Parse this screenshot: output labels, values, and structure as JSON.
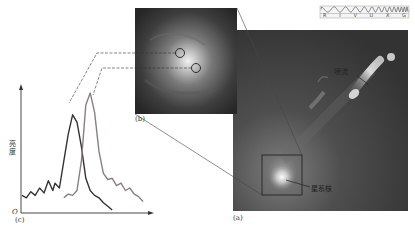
{
  "figure": {
    "panels": {
      "a": {
        "label": "(a)",
        "annotations": {
          "jet": "喷流",
          "nucleus": "星系核"
        }
      },
      "b": {
        "label": "(b)"
      },
      "c": {
        "label": "(c)",
        "origin": "O",
        "ylabel": "亮度"
      }
    },
    "spectrum_band": {
      "ticks": [
        "R",
        "I",
        "V",
        "U",
        "X",
        "G"
      ]
    },
    "colors": {
      "curve_dark": "#333333",
      "curve_light": "#8a7d84",
      "image_bg": "#4a4a4a",
      "connector": "#444444"
    }
  },
  "chart_data": {
    "type": "line",
    "title": "",
    "xlabel": "",
    "ylabel": "亮度",
    "series": [
      {
        "name": "dark profile (left peak)",
        "x": [
          0,
          4,
          8,
          12,
          16,
          20,
          24,
          28,
          30,
          34,
          38,
          42,
          46,
          50,
          54,
          58,
          62,
          66,
          70,
          74,
          78,
          82
        ],
        "values": [
          12,
          10,
          15,
          12,
          18,
          14,
          24,
          16,
          22,
          18,
          40,
          62,
          78,
          72,
          52,
          26,
          16,
          12,
          10,
          6,
          3,
          0
        ]
      },
      {
        "name": "light profile (right peak)",
        "x": [
          38,
          42,
          46,
          50,
          54,
          58,
          62,
          66,
          70,
          74,
          78,
          82,
          86,
          90,
          94,
          98,
          102,
          106,
          110
        ],
        "values": [
          10,
          13,
          12,
          16,
          40,
          86,
          96,
          80,
          48,
          30,
          25,
          26,
          20,
          22,
          16,
          18,
          13,
          11,
          7
        ]
      }
    ],
    "grid": false,
    "legend": "none"
  }
}
